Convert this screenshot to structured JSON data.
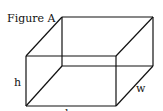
{
  "figure": {
    "title": "Figure A",
    "shape": "rectangular box (cuboid)",
    "labels": {
      "height": "h",
      "width": "w",
      "length": "l"
    },
    "colors": {
      "stroke": "#111111",
      "background": "#ffffff"
    }
  }
}
